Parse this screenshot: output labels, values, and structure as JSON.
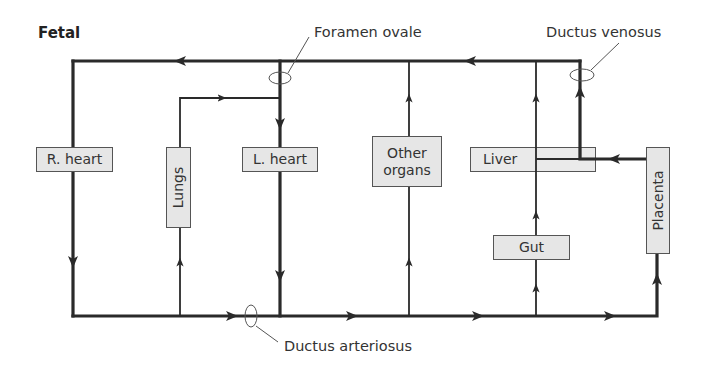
{
  "title": "Fetal",
  "labels": {
    "foramen_ovale": "Foramen ovale",
    "ductus_venosus": "Ductus venosus",
    "ductus_arteriosus": "Ductus arteriosus"
  },
  "boxes": {
    "r_heart": "R. heart",
    "lungs": "Lungs",
    "l_heart": "L. heart",
    "other_organs_line1": "Other",
    "other_organs_line2": "organs",
    "liver": "Liver",
    "gut": "Gut",
    "placenta": "Placenta"
  },
  "colors": {
    "line": "#2a2a2a",
    "box_fill": "#e6e6e6",
    "box_border": "#555555"
  }
}
